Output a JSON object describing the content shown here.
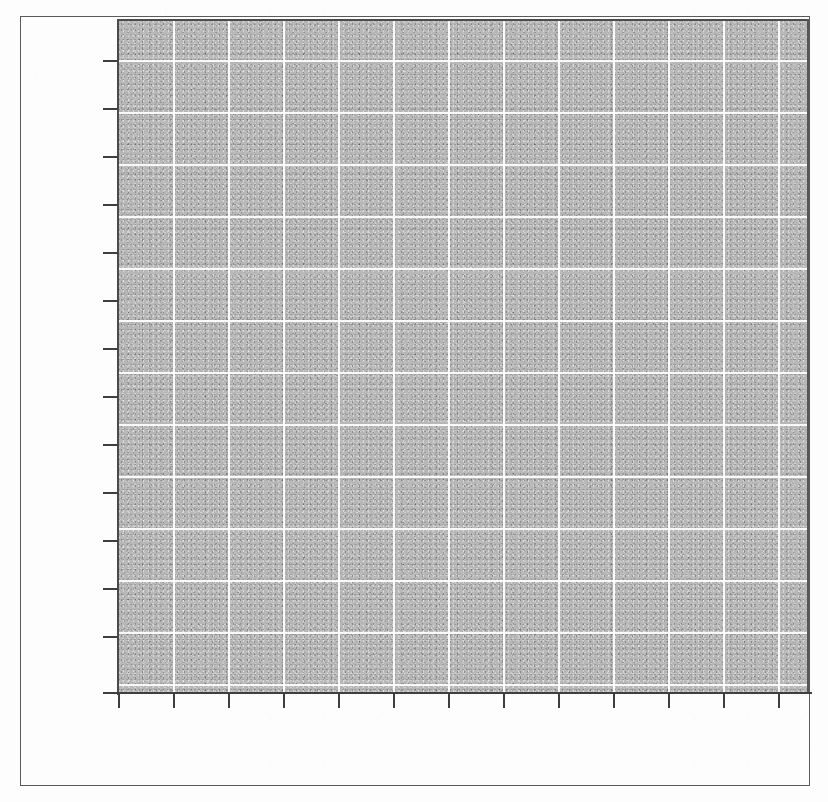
{
  "document": {
    "kind": "scanned-figure-page",
    "page_background": "#fdfdfd",
    "border_color": "#5a5a5a",
    "border": {
      "x": 20,
      "y": 16,
      "width": 790,
      "height": 770
    }
  },
  "chart_data": {
    "type": "heatmap",
    "title": "",
    "subtitle": "",
    "xlabel": "",
    "ylabel": "",
    "legend": [],
    "annotations": [],
    "grid": true,
    "legend_position": "none",
    "fill_color": "#b9b9b9",
    "gridline_color": "#ffffff",
    "axis_color": "#3f3f3f",
    "plot_rect": {
      "x": 118,
      "y": 20,
      "width": 690,
      "height": 672
    },
    "x_axis": {
      "tick_count": 13,
      "tick_labels": [],
      "tick_positions_px": [
        118,
        173,
        228,
        283,
        338,
        393,
        448,
        503,
        558,
        613,
        668,
        723,
        778
      ],
      "ticks_labeled": false,
      "spacing_px": 55,
      "xlim": [
        0,
        13
      ]
    },
    "y_axis": {
      "tick_count": 14,
      "tick_labels": [],
      "tick_positions_px": [
        60,
        108,
        156,
        204,
        252,
        300,
        348,
        396,
        444,
        492,
        540,
        588,
        636,
        692
      ],
      "ticks_labeled": false,
      "spacing_px": 48,
      "ylim": [
        0,
        13
      ]
    },
    "gridlines": {
      "vertical_px": [
        173,
        228,
        283,
        338,
        393,
        448,
        503,
        558,
        613,
        668,
        723,
        778
      ],
      "horizontal_px": [
        60,
        112,
        164,
        216,
        268,
        320,
        372,
        424,
        476,
        528,
        580,
        632,
        684
      ]
    },
    "values": [],
    "categories": []
  }
}
